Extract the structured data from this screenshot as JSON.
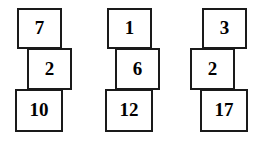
{
  "figure": {
    "background_color": "#ffffff",
    "box_border_color": "#1a1a1a",
    "box_fill_color": "#ffffff",
    "text_color": "#000000"
  },
  "stacks": [
    {
      "name": "stack-1",
      "boxes": [
        {
          "value": "7",
          "row": "top",
          "x": 17,
          "y": 8,
          "w": 45,
          "h": 41
        },
        {
          "value": "2",
          "row": "middle",
          "x": 27,
          "y": 48,
          "w": 45,
          "h": 42
        },
        {
          "value": "10",
          "row": "bottom",
          "x": 15,
          "y": 89,
          "w": 48,
          "h": 43
        }
      ]
    },
    {
      "name": "stack-2",
      "boxes": [
        {
          "value": "1",
          "row": "top",
          "x": 107,
          "y": 8,
          "w": 45,
          "h": 41
        },
        {
          "value": "6",
          "row": "middle",
          "x": 115,
          "y": 48,
          "w": 45,
          "h": 42
        },
        {
          "value": "12",
          "row": "bottom",
          "x": 105,
          "y": 89,
          "w": 48,
          "h": 43
        }
      ]
    },
    {
      "name": "stack-3",
      "boxes": [
        {
          "value": "3",
          "row": "top",
          "x": 202,
          "y": 8,
          "w": 45,
          "h": 41
        },
        {
          "value": "2",
          "row": "middle",
          "x": 190,
          "y": 48,
          "w": 45,
          "h": 42
        },
        {
          "value": "17",
          "row": "bottom",
          "x": 200,
          "y": 89,
          "w": 48,
          "h": 43
        }
      ]
    }
  ]
}
